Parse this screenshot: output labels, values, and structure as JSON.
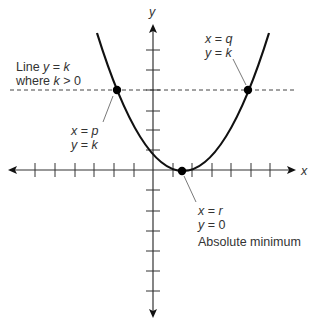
{
  "diagram": {
    "axes": {
      "x_label": "x",
      "y_label": "y",
      "tick_spacing_px": 20
    },
    "horizontal_line": {
      "label_line1_prefix": "Line ",
      "label_line1_var": "y",
      "label_line1_mid": " = ",
      "label_line1_val": "k",
      "label_line2_prefix": "where ",
      "label_line2_var": "k",
      "label_line2_rest": " > 0"
    },
    "points": {
      "p": {
        "line1_var": "x",
        "line1_eq": " = ",
        "line1_val": "p",
        "line2_var": "y",
        "line2_eq": " = ",
        "line2_val": "k"
      },
      "q": {
        "line1_var": "x",
        "line1_eq": " = ",
        "line1_val": "q",
        "line2_var": "y",
        "line2_eq": " = ",
        "line2_val": "k"
      },
      "r": {
        "line1_var": "x",
        "line1_eq": " = ",
        "line1_val": "r",
        "line2_var": "y",
        "line2_eq": " = ",
        "line2_val": "0",
        "caption": "Absolute minimum"
      }
    },
    "colors": {
      "curve": "#111111",
      "axis": "#333333",
      "dashed": "#444444",
      "text": "#333333"
    }
  }
}
